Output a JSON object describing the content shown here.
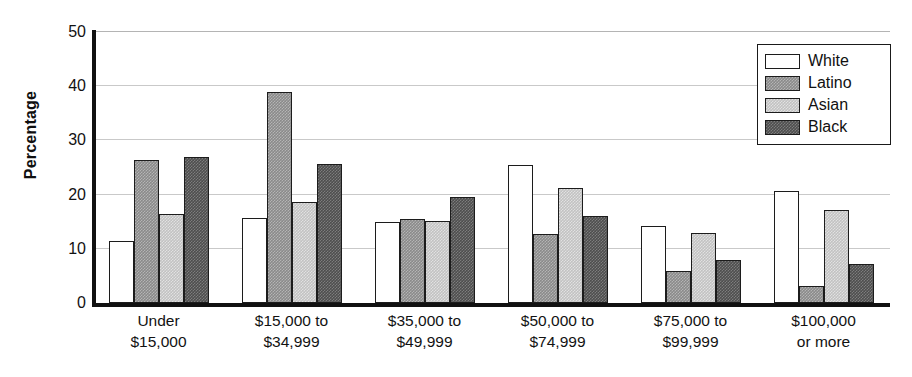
{
  "chart_data": {
    "type": "bar",
    "title": "",
    "xlabel": "",
    "ylabel": "Percentage",
    "ylim": [
      0,
      50
    ],
    "yticks": [
      0,
      10,
      20,
      30,
      40,
      50
    ],
    "grid": true,
    "legend_position": "top-right",
    "categories": [
      "Under $15,000",
      "$15,000 to $34,999",
      "$35,000 to $49,999",
      "$50,000 to $74,999",
      "$75,000 to $99,999",
      "$100,000 or more"
    ],
    "category_lines": [
      {
        "line1": "Under",
        "line2": "$15,000"
      },
      {
        "line1": "$15,000 to",
        "line2": "$34,999"
      },
      {
        "line1": "$35,000 to",
        "line2": "$49,999"
      },
      {
        "line1": "$50,000 to",
        "line2": "$74,999"
      },
      {
        "line1": "$75,000 to",
        "line2": "$99,999"
      },
      {
        "line1": "$100,000",
        "line2": "or more"
      }
    ],
    "series": [
      {
        "name": "White",
        "fill": "white",
        "color": "#ffffff",
        "values": [
          11.5,
          15.7,
          15.0,
          25.4,
          14.3,
          20.7
        ]
      },
      {
        "name": "Latino",
        "fill": "latino",
        "color": "#8a8a8a",
        "values": [
          26.4,
          39.0,
          15.5,
          12.7,
          5.9,
          3.2
        ]
      },
      {
        "name": "Asian",
        "fill": "asian",
        "color": "#c2c2c2",
        "values": [
          16.5,
          18.6,
          15.2,
          21.2,
          13.0,
          17.2
        ]
      },
      {
        "name": "Black",
        "fill": "black",
        "color": "#4e4e4e",
        "values": [
          27.0,
          25.7,
          19.5,
          16.0,
          7.9,
          7.2
        ]
      }
    ]
  },
  "legend": {
    "items": [
      {
        "label": "White",
        "fill": "white"
      },
      {
        "label": "Latino",
        "fill": "latino"
      },
      {
        "label": "Asian",
        "fill": "asian"
      },
      {
        "label": "Black",
        "fill": "black"
      }
    ]
  }
}
